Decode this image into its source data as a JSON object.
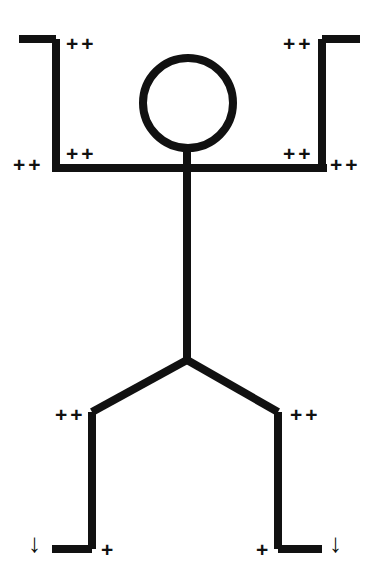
{
  "figure": {
    "stroke_color": "#111111",
    "background_color": "#ffffff",
    "stroke_width": 8,
    "canvas": {
      "width": 377,
      "height": 588
    }
  },
  "body_parts": [
    {
      "name": "head",
      "type": "circle",
      "cx": 188,
      "cy": 103,
      "r": 45
    },
    {
      "name": "neck",
      "type": "line",
      "x1": 187,
      "y1": 146,
      "x2": 187,
      "y2": 172
    },
    {
      "name": "shoulder-bar",
      "type": "line",
      "x1": 52,
      "y1": 168,
      "x2": 327,
      "y2": 168
    },
    {
      "name": "left-upper-arm",
      "type": "line",
      "x1": 56,
      "y1": 168,
      "x2": 56,
      "y2": 39
    },
    {
      "name": "left-forearm",
      "type": "line",
      "x1": 56,
      "y1": 39,
      "x2": 19,
      "y2": 39
    },
    {
      "name": "right-upper-arm",
      "type": "line",
      "x1": 322,
      "y1": 168,
      "x2": 322,
      "y2": 39
    },
    {
      "name": "right-forearm",
      "type": "line",
      "x1": 322,
      "y1": 39,
      "x2": 360,
      "y2": 39
    },
    {
      "name": "torso",
      "type": "line",
      "x1": 187,
      "y1": 168,
      "x2": 187,
      "y2": 360
    },
    {
      "name": "left-thigh",
      "type": "line",
      "x1": 187,
      "y1": 360,
      "x2": 92,
      "y2": 412
    },
    {
      "name": "left-shin",
      "type": "line",
      "x1": 92,
      "y1": 412,
      "x2": 92,
      "y2": 549
    },
    {
      "name": "left-foot",
      "type": "line",
      "x1": 92,
      "y1": 549,
      "x2": 52,
      "y2": 549
    },
    {
      "name": "right-thigh",
      "type": "line",
      "x1": 187,
      "y1": 360,
      "x2": 278,
      "y2": 412
    },
    {
      "name": "right-shin",
      "type": "line",
      "x1": 278,
      "y1": 412,
      "x2": 278,
      "y2": 549
    },
    {
      "name": "right-foot",
      "type": "line",
      "x1": 278,
      "y1": 549,
      "x2": 322,
      "y2": 549
    }
  ],
  "markers": [
    {
      "id": "left-wrist",
      "label": "++",
      "kind": "plusplus",
      "x": 66,
      "y": 33
    },
    {
      "id": "right-wrist",
      "label": "++",
      "kind": "plusplus",
      "x": 283,
      "y": 33
    },
    {
      "id": "left-shoulder-inner",
      "label": "++",
      "kind": "plusplus",
      "x": 66,
      "y": 143
    },
    {
      "id": "right-shoulder-inner",
      "label": "++",
      "kind": "plusplus",
      "x": 283,
      "y": 143
    },
    {
      "id": "left-shoulder-outer",
      "label": "++",
      "kind": "plusplus",
      "x": 13,
      "y": 154
    },
    {
      "id": "right-shoulder-outer",
      "label": "++",
      "kind": "plusplus",
      "x": 330,
      "y": 154
    },
    {
      "id": "left-knee",
      "label": "++",
      "kind": "plusplus",
      "x": 55,
      "y": 404
    },
    {
      "id": "right-knee",
      "label": "++",
      "kind": "plusplus",
      "x": 290,
      "y": 404
    },
    {
      "id": "left-ankle",
      "label": "+",
      "kind": "plus",
      "x": 101,
      "y": 539
    },
    {
      "id": "right-ankle",
      "label": "+",
      "kind": "plus",
      "x": 256,
      "y": 539
    },
    {
      "id": "left-foot-arrow",
      "label": "↓",
      "kind": "arrow",
      "x": 28,
      "y": 530
    },
    {
      "id": "right-foot-arrow",
      "label": "↓",
      "kind": "arrow",
      "x": 329,
      "y": 530
    }
  ]
}
